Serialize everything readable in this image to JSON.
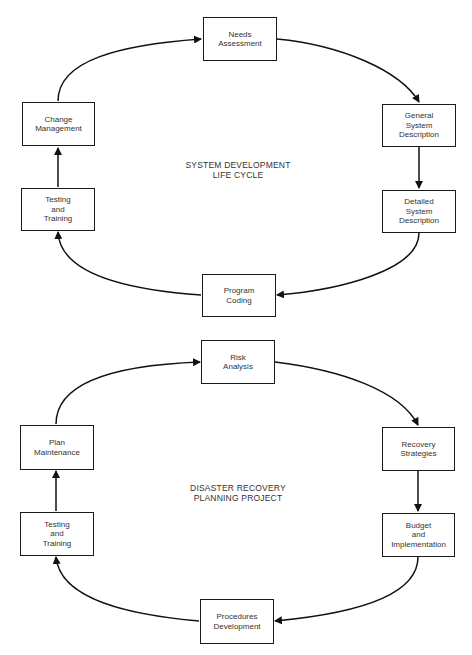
{
  "diagrams": [
    {
      "title": [
        "SYSTEM DEVELOPMENT",
        "LIFE CYCLE"
      ],
      "nodes": [
        {
          "id": "needs-assessment",
          "lines": [
            "Needs",
            "Assessment"
          ]
        },
        {
          "id": "general-system-description",
          "lines": [
            "General",
            "System",
            "Description"
          ]
        },
        {
          "id": "detailed-system-description",
          "lines": [
            "Detailed",
            "System",
            "Description"
          ]
        },
        {
          "id": "program-coding",
          "lines": [
            "Program",
            "Coding"
          ]
        },
        {
          "id": "testing-and-training",
          "lines": [
            "Testing",
            "and",
            "Training"
          ]
        },
        {
          "id": "change-management",
          "lines": [
            "Change",
            "Management"
          ]
        }
      ],
      "edges": [
        [
          "needs-assessment",
          "general-system-description"
        ],
        [
          "general-system-description",
          "detailed-system-description"
        ],
        [
          "detailed-system-description",
          "program-coding"
        ],
        [
          "program-coding",
          "testing-and-training"
        ],
        [
          "testing-and-training",
          "change-management"
        ],
        [
          "change-management",
          "needs-assessment"
        ]
      ]
    },
    {
      "title": [
        "DISASTER RECOVERY",
        "PLANNING PROJECT"
      ],
      "nodes": [
        {
          "id": "risk-analysis",
          "lines": [
            "Risk",
            "Analysis"
          ]
        },
        {
          "id": "recovery-strategies",
          "lines": [
            "Recovery",
            "Strategies"
          ]
        },
        {
          "id": "budget-and-implementation",
          "lines": [
            "Budget",
            "and",
            "Implementation"
          ]
        },
        {
          "id": "procedures-development",
          "lines": [
            "Procedures",
            "Development"
          ]
        },
        {
          "id": "testing-and-training",
          "lines": [
            "Testing",
            "and",
            "Training"
          ]
        },
        {
          "id": "plan-maintenance",
          "lines": [
            "Plan",
            "Maintenance"
          ]
        }
      ],
      "edges": [
        [
          "risk-analysis",
          "recovery-strategies"
        ],
        [
          "recovery-strategies",
          "budget-and-implementation"
        ],
        [
          "budget-and-implementation",
          "procedures-development"
        ],
        [
          "procedures-development",
          "testing-and-training"
        ],
        [
          "testing-and-training",
          "plan-maintenance"
        ],
        [
          "plan-maintenance",
          "risk-analysis"
        ]
      ]
    }
  ]
}
